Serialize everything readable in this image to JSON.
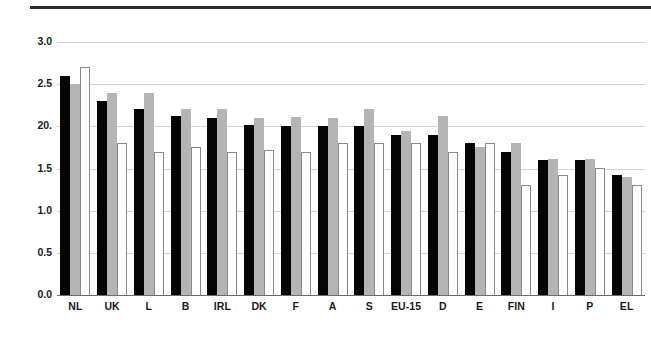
{
  "figure": {
    "top_rule": "horizontal-rule",
    "background_color": "#ffffff"
  },
  "chart_data": {
    "type": "bar",
    "title": "",
    "subtitle": "",
    "xlabel": "",
    "ylabel": "",
    "ylim": [
      0.0,
      3.0
    ],
    "grid": true,
    "legend_position": "none",
    "categories": [
      "NL",
      "UK",
      "L",
      "B",
      "IRL",
      "DK",
      "F",
      "A",
      "S",
      "EU-15",
      "D",
      "E",
      "FIN",
      "I",
      "P",
      "EL"
    ],
    "ytick_labels": [
      "3.0",
      "2.5",
      "20.",
      "1.5",
      "1.0",
      "0.5",
      "0.0"
    ],
    "ytick_values": [
      3.0,
      2.5,
      2.0,
      1.5,
      1.0,
      0.5,
      0.0
    ],
    "series": [
      {
        "name": "series-1",
        "color": "#050505",
        "style": "filled-black",
        "values": [
          2.6,
          2.3,
          2.2,
          2.12,
          2.1,
          2.02,
          2.0,
          2.01,
          2.01,
          1.9,
          1.9,
          1.8,
          1.7,
          1.6,
          1.6,
          1.42
        ]
      },
      {
        "name": "series-2",
        "color": "#b4b4b4",
        "style": "filled-gray",
        "values": [
          2.5,
          2.4,
          2.4,
          2.21,
          2.21,
          2.1,
          2.11,
          2.1,
          2.21,
          1.95,
          2.12,
          1.76,
          1.8,
          1.61,
          1.61,
          1.4
        ]
      },
      {
        "name": "series-3",
        "color": "#ffffff",
        "style": "outlined-white",
        "values": [
          2.7,
          1.8,
          1.7,
          1.75,
          1.7,
          1.72,
          1.7,
          1.8,
          1.8,
          1.8,
          1.7,
          1.8,
          1.31,
          1.42,
          1.51,
          1.3
        ]
      }
    ]
  }
}
